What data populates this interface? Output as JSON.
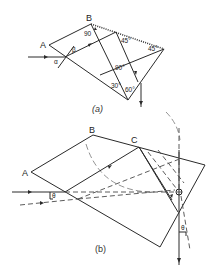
{
  "figure_a": {
    "caption": "(a)",
    "vertex_labels": {
      "A": "A",
      "B": "B"
    },
    "angle_labels": {
      "at_B": "90",
      "top_mid": "45°",
      "right": "45°",
      "center": "90°",
      "lower_left": "30°",
      "lower_right": "60°"
    },
    "incidence_labels": {
      "alpha": "α",
      "beta": "β"
    }
  },
  "figure_b": {
    "caption": "(b)",
    "vertex_labels": {
      "A": "A",
      "B": "B",
      "C": "C",
      "O": "O"
    },
    "angle_labels": {
      "theta_in": "θ",
      "theta_out": "θ"
    }
  }
}
